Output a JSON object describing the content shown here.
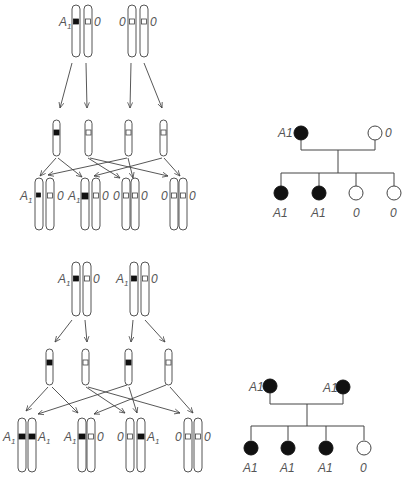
{
  "figure": {
    "colors": {
      "dominant_allele": "#111111",
      "recessive_allele": "#ffffff",
      "line": "#444444"
    }
  },
  "panel_top": {
    "cross": "A1/0 × 0/0",
    "parents": [
      {
        "alleles": [
          "A1",
          "0"
        ],
        "labels": {
          "left": "A1",
          "right": "0"
        }
      },
      {
        "alleles": [
          "0",
          "0"
        ],
        "labels": {
          "left": "0",
          "right": "0"
        }
      }
    ],
    "gametes": [
      "A1",
      "0",
      "0",
      "0"
    ],
    "offspring": [
      {
        "alleles": [
          "A1",
          "0"
        ],
        "labels": {
          "left": "A1",
          "right": "0"
        }
      },
      {
        "alleles": [
          "A1",
          "0"
        ],
        "labels": {
          "left": "A1",
          "right": "0"
        }
      },
      {
        "alleles": [
          "0",
          "0"
        ],
        "labels": {
          "left": "0",
          "right": "0"
        }
      },
      {
        "alleles": [
          "0",
          "0"
        ],
        "labels": {
          "left": "0",
          "right": "0"
        }
      }
    ],
    "pedigree": {
      "parents": [
        {
          "phenotype": "A1",
          "affected": true,
          "label": "A1"
        },
        {
          "phenotype": "0",
          "affected": false,
          "label": "0"
        }
      ],
      "children": [
        {
          "phenotype": "A1",
          "affected": true,
          "label": "A1"
        },
        {
          "phenotype": "A1",
          "affected": true,
          "label": "A1"
        },
        {
          "phenotype": "0",
          "affected": false,
          "label": "0"
        },
        {
          "phenotype": "0",
          "affected": false,
          "label": "0"
        }
      ]
    }
  },
  "panel_bottom": {
    "cross": "A1/0 × A1/0",
    "parents": [
      {
        "alleles": [
          "A1",
          "0"
        ],
        "labels": {
          "left": "A1",
          "right": "0"
        }
      },
      {
        "alleles": [
          "A1",
          "0"
        ],
        "labels": {
          "left": "A1",
          "right": "0"
        }
      }
    ],
    "gametes": [
      "A1",
      "0",
      "A1",
      "0"
    ],
    "offspring": [
      {
        "alleles": [
          "A1",
          "A1"
        ],
        "labels": {
          "left": "A1",
          "right": "A1"
        }
      },
      {
        "alleles": [
          "A1",
          "0"
        ],
        "labels": {
          "left": "A1",
          "right": "0"
        }
      },
      {
        "alleles": [
          "0",
          "A1"
        ],
        "labels": {
          "left": "0",
          "right": "A1"
        }
      },
      {
        "alleles": [
          "0",
          "0"
        ],
        "labels": {
          "left": "0",
          "right": "0"
        }
      }
    ],
    "pedigree": {
      "parents": [
        {
          "phenotype": "A1",
          "affected": true,
          "label": "A1"
        },
        {
          "phenotype": "A1",
          "affected": true,
          "label": "A1"
        }
      ],
      "children": [
        {
          "phenotype": "A1",
          "affected": true,
          "label": "A1"
        },
        {
          "phenotype": "A1",
          "affected": true,
          "label": "A1"
        },
        {
          "phenotype": "A1",
          "affected": true,
          "label": "A1"
        },
        {
          "phenotype": "0",
          "affected": false,
          "label": "0"
        }
      ]
    }
  },
  "labels": {
    "A": "A",
    "one": "1",
    "zero": "0"
  }
}
